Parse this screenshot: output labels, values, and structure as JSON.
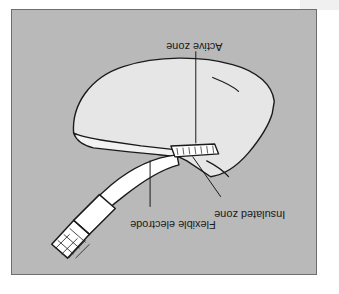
{
  "figure": {
    "orientation": "rotated-180",
    "panel_background": "#b9b9b9",
    "panel_border": "#6e6e6e",
    "page_background": "#ffffff",
    "ink_color": "#1a1a1a",
    "tissue_fill": "#e6e6e6",
    "device_fill": "#ffffff"
  },
  "annotations": [
    {
      "id": "active-zone",
      "label": "Active zone",
      "label_x": 212,
      "label_y": 33,
      "leader": "vertical",
      "points_to": "electrode active tip"
    },
    {
      "id": "insulated-zone",
      "label": "Insulated zone",
      "label_x": 275,
      "label_y": 203,
      "leader": "diagonal",
      "points_to": "electrode insulated section"
    },
    {
      "id": "flexible-electrode",
      "label": "Flexible electrode",
      "label_x": 205,
      "label_y": 213,
      "leader": "vertical",
      "points_to": "electrode shaft"
    }
  ],
  "parts": [
    {
      "id": "tissue-body",
      "name": "Anatomical tissue (dome)"
    },
    {
      "id": "tissue-lip",
      "name": "Tissue under-lip"
    },
    {
      "id": "tissue-crease",
      "name": "Tissue crease"
    },
    {
      "id": "electrode-shaft",
      "name": "Flexible electrode shaft"
    },
    {
      "id": "electrode-active-tip",
      "name": "Active zone tip (hatched)"
    },
    {
      "id": "electrode-handle",
      "name": "Electrode handle / connector"
    },
    {
      "id": "electrode-grip-hatch",
      "name": "Handle crosshatch grip"
    }
  ]
}
